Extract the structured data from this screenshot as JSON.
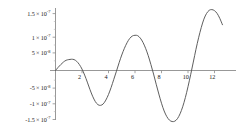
{
  "chart_data": {
    "type": "line",
    "title": "",
    "subtitle": "",
    "xlabel": "",
    "ylabel": "",
    "grid": false,
    "legend": null,
    "xlim": [
      0,
      13.5
    ],
    "ylim": [
      -1.75e-07,
      1.9e-07
    ],
    "x_ticks": [
      {
        "value": 2,
        "label": "2"
      },
      {
        "value": 4,
        "label": "4"
      },
      {
        "value": 6,
        "label": "6"
      },
      {
        "value": 8,
        "label": "8"
      },
      {
        "value": 10,
        "label": "10"
      },
      {
        "value": 12,
        "label": "12"
      }
    ],
    "y_ticks": [
      {
        "value": 1.5e-07,
        "mantissa": "1.5",
        "times": "×",
        "base": "10",
        "exponent": "-7"
      },
      {
        "value": 1e-07,
        "mantissa": "1",
        "times": "×",
        "base": "10",
        "exponent": "-7"
      },
      {
        "value": 5e-08,
        "mantissa": "5",
        "times": "×",
        "base": "10",
        "exponent": "-8"
      },
      {
        "value": -5e-08,
        "mantissa": "-5",
        "times": "×",
        "base": "10",
        "exponent": "-8"
      },
      {
        "value": -1e-07,
        "mantissa": "-1",
        "times": "×",
        "base": "10",
        "exponent": "-7"
      },
      {
        "value": -1.5e-07,
        "mantissa": "-1.5",
        "times": "×",
        "base": "10",
        "exponent": "-7"
      }
    ],
    "y_tick_labels": [
      "1.5×10^-7",
      "1×10^-7",
      "5×10^-8",
      "-5×10^-8",
      "-1×10^-7",
      "-1.5×10^-7"
    ],
    "x_tick_labels": [
      "2",
      "4",
      "6",
      "8",
      "10",
      "12"
    ],
    "series": [
      {
        "name": "curve",
        "color": "#555555",
        "x": [
          0.0,
          0.2,
          0.4,
          0.6,
          0.8,
          1.0,
          1.2,
          1.4,
          1.6,
          1.8,
          2.0,
          2.2,
          2.4,
          2.6,
          2.8,
          3.0,
          3.2,
          3.4,
          3.6,
          3.8,
          4.0,
          4.2,
          4.4,
          4.6,
          4.8,
          5.0,
          5.2,
          5.4,
          5.6,
          5.8,
          6.0,
          6.2,
          6.4,
          6.6,
          6.8,
          7.0,
          7.2,
          7.4,
          7.6,
          7.8,
          8.0,
          8.2,
          8.4,
          8.6,
          8.8,
          9.0,
          9.2,
          9.4,
          9.6,
          9.8,
          10.0,
          10.2,
          10.4,
          10.6,
          10.8,
          11.0,
          11.2,
          11.4,
          11.6,
          11.8,
          12.0,
          12.2,
          12.4,
          12.6
        ],
        "y": [
          0.0,
          9e-09,
          1.7e-08,
          2.4e-08,
          2.9e-08,
          3.1e-08,
          3.2e-08,
          3.1e-08,
          2.6e-08,
          1.7e-08,
          4e-09,
          -1.3e-08,
          -3.3e-08,
          -5.4e-08,
          -7.3e-08,
          -8.8e-08,
          -9.7e-08,
          -9.9e-08,
          -9.5e-08,
          -8.4e-08,
          -6.8e-08,
          -4.8e-08,
          -2.5e-08,
          -2e-09,
          2.2e-08,
          4.4e-08,
          6.3e-08,
          7.9e-08,
          9.1e-08,
          9.8e-08,
          1e-07,
          9.9e-08,
          9.2e-08,
          8e-08,
          6.3e-08,
          4.2e-08,
          1.7e-08,
          -1e-08,
          -3.9e-08,
          -6.7e-08,
          -9.3e-08,
          -1.15e-07,
          -1.31e-07,
          -1.41e-07,
          -1.45e-07,
          -1.44e-07,
          -1.37e-07,
          -1.23e-07,
          -1.03e-07,
          -7.7e-08,
          -4.6e-08,
          -1.2e-08,
          2.4e-08,
          6e-08,
          9.3e-08,
          1.22e-07,
          1.46e-07,
          1.62e-07,
          1.71e-07,
          1.73e-07,
          1.7e-07,
          1.62e-07,
          1.48e-07,
          1.3e-07
        ]
      }
    ],
    "annotations": [],
    "features": {
      "first_bump_peak": {
        "x": 1.3,
        "y": 3.2e-08
      },
      "first_trough": {
        "x": 3.3,
        "y": -9.9e-08
      },
      "second_peak": {
        "x": 6.1,
        "y": 1e-07
      },
      "second_trough": {
        "x": 8.85,
        "y": -1.45e-07
      },
      "third_peak": {
        "x": 11.85,
        "y": 1.73e-07
      }
    }
  },
  "axes": {
    "x_axis_name": "horizontal-axis",
    "y_axis_name": "vertical-axis",
    "axis_color": "#808080",
    "curve_color": "#555555",
    "background": "#ffffff"
  }
}
